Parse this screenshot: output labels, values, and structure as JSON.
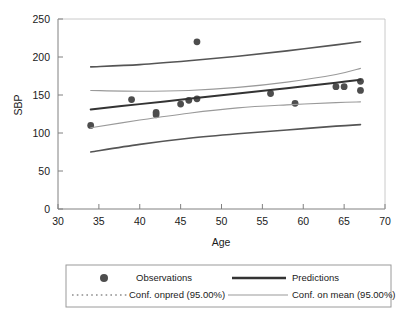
{
  "chart_data": {
    "type": "scatter",
    "title": "",
    "xlabel": "Age",
    "ylabel": "SBP",
    "xlim": [
      30,
      70
    ],
    "ylim": [
      0,
      250
    ],
    "xticks": [
      30,
      35,
      40,
      45,
      50,
      55,
      60,
      65,
      70
    ],
    "yticks": [
      0,
      50,
      100,
      150,
      200,
      250
    ],
    "grid": false,
    "legend_position": "bottom",
    "series": [
      {
        "name": "Observations",
        "type": "scatter",
        "color": "#4d4d4d",
        "points": [
          {
            "x": 34,
            "y": 110
          },
          {
            "x": 39,
            "y": 144
          },
          {
            "x": 42,
            "y": 124
          },
          {
            "x": 42,
            "y": 127
          },
          {
            "x": 45,
            "y": 138
          },
          {
            "x": 46,
            "y": 143
          },
          {
            "x": 47,
            "y": 145
          },
          {
            "x": 47,
            "y": 220
          },
          {
            "x": 56,
            "y": 152
          },
          {
            "x": 59,
            "y": 139
          },
          {
            "x": 64,
            "y": 161
          },
          {
            "x": 65,
            "y": 161
          },
          {
            "x": 67,
            "y": 168
          },
          {
            "x": 67,
            "y": 156
          }
        ]
      },
      {
        "name": "Predictions",
        "type": "line",
        "color": "#333333",
        "x": [
          34,
          40,
          46,
          52,
          58,
          64,
          67
        ],
        "values": [
          131,
          138,
          145,
          152,
          159,
          166,
          170
        ]
      },
      {
        "name": "Conf. onpred (95.00%) upper",
        "type": "line",
        "color": "#555555",
        "x": [
          34,
          40,
          46,
          52,
          58,
          64,
          67
        ],
        "values": [
          187,
          190,
          195,
          201,
          208,
          216,
          220
        ]
      },
      {
        "name": "Conf. onpred (95.00%) lower",
        "type": "line",
        "color": "#555555",
        "x": [
          34,
          40,
          46,
          52,
          58,
          64,
          67
        ],
        "values": [
          75,
          85,
          93,
          99,
          104,
          109,
          111
        ]
      },
      {
        "name": "Conf. on mean (95.00%) upper",
        "type": "line",
        "color": "#9a9a9a",
        "x": [
          34,
          40,
          46,
          52,
          58,
          64,
          67
        ],
        "values": [
          156,
          155,
          156,
          160,
          167,
          177,
          185
        ]
      },
      {
        "name": "Conf. on mean (95.00%) lower",
        "type": "line",
        "color": "#9a9a9a",
        "x": [
          34,
          40,
          46,
          52,
          58,
          64,
          67
        ],
        "values": [
          107,
          117,
          126,
          133,
          137,
          140,
          141
        ]
      }
    ]
  },
  "axes": {
    "x_title": "Age",
    "y_title": "SBP",
    "x_tick_labels": [
      "30",
      "35",
      "40",
      "45",
      "50",
      "55",
      "60",
      "65",
      "70"
    ],
    "y_tick_labels": [
      "0",
      "50",
      "100",
      "150",
      "200",
      "250"
    ]
  },
  "legend": {
    "entries": [
      {
        "label": "Observations",
        "marker": "dot",
        "color": "#4d4d4d"
      },
      {
        "label": "Predictions",
        "marker": "solid-thick",
        "color": "#333333"
      },
      {
        "label": "Conf. onpred (95.00%)",
        "marker": "dotted",
        "color": "#555555"
      },
      {
        "label": "Conf. on mean (95.00%)",
        "marker": "solid-thin",
        "color": "#9a9a9a"
      }
    ]
  },
  "colors": {
    "background": "#ffffff",
    "axis": "#808080",
    "text": "#1a1a1a",
    "observations": "#4d4d4d",
    "predictions": "#333333",
    "conf_pred": "#555555",
    "conf_mean": "#9a9a9a",
    "legend_border": "#9a9a9a"
  }
}
